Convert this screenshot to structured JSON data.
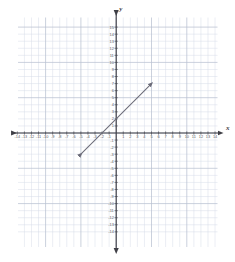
{
  "chart_data": {
    "type": "line",
    "title": "",
    "xlabel": "x",
    "ylabel": "y",
    "xlim": [
      -14.6,
      14.6
    ],
    "ylim": [
      -14.6,
      15.2
    ],
    "grid": true,
    "minor_grid_step": 1,
    "major_grid_step": 5,
    "legend": "none",
    "x_ticks": [
      -14,
      -13,
      -12,
      -11,
      -10,
      -9,
      -8,
      -7,
      -6,
      -5,
      -4,
      -3,
      -2,
      -1,
      1,
      2,
      3,
      4,
      5,
      6,
      7,
      8,
      9,
      10,
      11,
      12,
      13,
      14
    ],
    "y_ticks": [
      15,
      14,
      13,
      12,
      11,
      10,
      9,
      8,
      7,
      6,
      5,
      4,
      3,
      2,
      1,
      -1,
      -2,
      -3,
      -4,
      -5,
      -6,
      -7,
      -8,
      -9,
      -10,
      -11,
      -12,
      -13,
      -14
    ],
    "x_tick_labels": [
      "-14",
      "-13",
      "-12",
      "-11",
      "-10",
      "-9",
      "-8",
      "-7",
      "-6",
      "-5",
      "-4",
      "-3",
      "-2",
      "-1",
      "1",
      "2",
      "3",
      "4",
      "5",
      "6",
      "7",
      "8",
      "9",
      "10",
      "11",
      "12",
      "13",
      "14"
    ],
    "y_tick_labels": [
      "15",
      "14",
      "13",
      "12",
      "11",
      "10",
      "9",
      "8",
      "7",
      "6",
      "5",
      "4",
      "3",
      "2",
      "1",
      "-1",
      "-2",
      "-3",
      "-4",
      "-5",
      "-6",
      "-7",
      "-8",
      "-9",
      "-10",
      "-11",
      "-12",
      "-13",
      "-14"
    ],
    "series": [
      {
        "name": "plotted-line",
        "type": "segment-with-arrows",
        "slope": 1,
        "intercept": 2,
        "equation": "y = x + 2",
        "x_intercept": -2,
        "y_intercept": 2,
        "start_point": [
          -5,
          -3
        ],
        "end_point": [
          5,
          7
        ],
        "arrow_start": true,
        "arrow_end": true,
        "color": "#6b6b78"
      }
    ],
    "colors": {
      "minor_grid": "#d6dce8",
      "major_grid": "#b9c2d2",
      "axis": "#3f3f46",
      "line": "#6b6b78",
      "tick_text": "#5b5b63"
    }
  },
  "axis_labels": {
    "x": "x",
    "y": "y"
  }
}
